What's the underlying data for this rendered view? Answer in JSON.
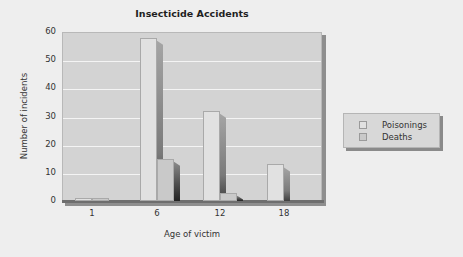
{
  "chart_data": {
    "type": "bar",
    "title": "Insecticide Accidents",
    "xlabel": "Age of victim",
    "ylabel": "Number of incidents",
    "categories": [
      "1",
      "6",
      "12",
      "18"
    ],
    "series": [
      {
        "name": "Poisonings",
        "values": [
          1,
          58,
          32,
          13
        ],
        "color": "#e1e1e1"
      },
      {
        "name": "Deaths",
        "values": [
          1,
          15,
          3,
          0
        ],
        "color": "#c9c9c9"
      }
    ],
    "ylim": [
      0,
      60
    ],
    "yticks": [
      "0",
      "10",
      "20",
      "30",
      "40",
      "50",
      "60"
    ],
    "grid": true,
    "legend_position": "right",
    "style": "3d-bar"
  },
  "title": "Insecticide Accidents",
  "axes": {
    "xlabel": "Age of victim",
    "ylabel": "Number of incidents",
    "yticks": [
      "0",
      "10",
      "20",
      "30",
      "40",
      "50",
      "60"
    ],
    "xticks": [
      "1",
      "6",
      "12",
      "18"
    ]
  },
  "legend": {
    "items": [
      {
        "label": "Poisonings"
      },
      {
        "label": "Deaths"
      }
    ]
  },
  "colors": {
    "background": "#eeeeee",
    "plot_background": "#d3d3d3",
    "gridline": "#f4f4f4",
    "poisonings": "#e1e1e1",
    "deaths": "#c9c9c9"
  }
}
